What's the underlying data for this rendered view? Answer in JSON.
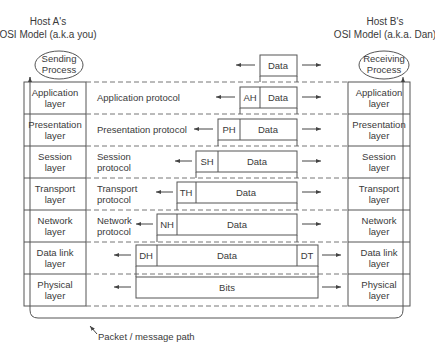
{
  "hosts": {
    "a": {
      "line1": "Host A's",
      "line2": "OSI Model (a.k.a you)"
    },
    "b": {
      "line1": "Host B's",
      "line2": "OSI Model (a.k.a. Dan)"
    }
  },
  "processes": {
    "sending": {
      "line1": "Sending",
      "line2": "Process"
    },
    "receiving": {
      "line1": "Receiving",
      "line2": "Process"
    }
  },
  "top_data": {
    "label": "Data"
  },
  "layers": [
    {
      "name1": "Application",
      "name2": "layer",
      "proto1": "Application protocol",
      "proto2": "",
      "header": "AH",
      "payload": "Data",
      "trailer": ""
    },
    {
      "name1": "Presentation",
      "name2": "layer",
      "proto1": "Presentation protocol",
      "proto2": "",
      "header": "PH",
      "payload": "Data",
      "trailer": ""
    },
    {
      "name1": "Session",
      "name2": "layer",
      "proto1": "Session",
      "proto2": "protocol",
      "header": "SH",
      "payload": "Data",
      "trailer": ""
    },
    {
      "name1": "Transport",
      "name2": "layer",
      "proto1": "Transport",
      "proto2": "protocol",
      "header": "TH",
      "payload": "Data",
      "trailer": ""
    },
    {
      "name1": "Network",
      "name2": "layer",
      "proto1": "Network",
      "proto2": "protocol",
      "header": "NH",
      "payload": "Data",
      "trailer": ""
    },
    {
      "name1": "Data link",
      "name2": "layer",
      "proto1": "",
      "proto2": "",
      "header": "DH",
      "payload": "Data",
      "trailer": "DT"
    },
    {
      "name1": "Physical",
      "name2": "layer",
      "proto1": "",
      "proto2": "",
      "header": "",
      "payload": "Bits",
      "trailer": ""
    }
  ],
  "path_label": "Packet / message path",
  "colors": {
    "line": "#555555",
    "text": "#3a3a3a",
    "dash": "#777777"
  }
}
